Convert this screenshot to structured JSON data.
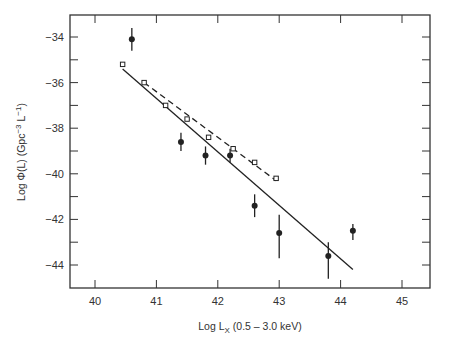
{
  "chart_data": {
    "type": "scatter",
    "title": "",
    "xlabel": "Log L_X (0.5 – 3.0 keV)",
    "ylabel": "Log Φ(L) (Gpc⁻³ L⁻¹)",
    "xlim": [
      39.6,
      45.4
    ],
    "ylim": [
      -45,
      -33
    ],
    "x_ticks": [
      40,
      41,
      42,
      43,
      44,
      45
    ],
    "y_ticks": [
      -34,
      -36,
      -38,
      -40,
      -42,
      -44
    ],
    "x_tick_labels": [
      "40",
      "41",
      "42",
      "43",
      "44",
      "45"
    ],
    "y_tick_labels": [
      "−34",
      "−36",
      "−38",
      "−40",
      "−42",
      "−44"
    ],
    "grid": false,
    "legend": null,
    "series": [
      {
        "name": "filled circles (with error bars)",
        "marker": "filled-circle",
        "points": [
          {
            "x": 40.6,
            "y": -34.1,
            "err_lo": 0.5,
            "err_hi": 0.5
          },
          {
            "x": 41.4,
            "y": -38.6,
            "err_lo": 0.4,
            "err_hi": 0.4
          },
          {
            "x": 41.8,
            "y": -39.2,
            "err_lo": 0.4,
            "err_hi": 0.4
          },
          {
            "x": 42.2,
            "y": -39.2,
            "err_lo": 0.3,
            "err_hi": 0.3
          },
          {
            "x": 42.6,
            "y": -41.4,
            "err_lo": 0.5,
            "err_hi": 0.5
          },
          {
            "x": 43.0,
            "y": -42.6,
            "err_lo": 1.1,
            "err_hi": 0.8
          },
          {
            "x": 43.8,
            "y": -43.6,
            "err_lo": 1.0,
            "err_hi": 0.6
          },
          {
            "x": 44.2,
            "y": -42.5,
            "err_lo": 0.4,
            "err_hi": 0.3
          }
        ]
      },
      {
        "name": "open squares",
        "marker": "open-square",
        "points": [
          {
            "x": 40.45,
            "y": -35.2
          },
          {
            "x": 40.8,
            "y": -36.0
          },
          {
            "x": 41.15,
            "y": -37.0
          },
          {
            "x": 41.5,
            "y": -37.6
          },
          {
            "x": 41.85,
            "y": -38.4
          },
          {
            "x": 42.25,
            "y": -38.9
          },
          {
            "x": 42.6,
            "y": -39.5
          },
          {
            "x": 42.95,
            "y": -40.2
          }
        ]
      },
      {
        "name": "solid fit line",
        "style": "solid",
        "points": [
          {
            "x": 40.45,
            "y": -35.4
          },
          {
            "x": 44.2,
            "y": -44.2
          }
        ]
      },
      {
        "name": "dashed fit line",
        "style": "dashed",
        "points": [
          {
            "x": 40.8,
            "y": -36.0
          },
          {
            "x": 42.95,
            "y": -40.3
          }
        ]
      }
    ]
  },
  "axes": {
    "x_label_main": "Log L",
    "x_label_sub": "X",
    "x_label_rest": " (0.5 – 3.0 keV)",
    "y_label_main": "Log Φ(L) (Gpc",
    "y_label_sup1": "−3",
    "y_label_mid": " L",
    "y_label_sup2": "−1",
    "y_label_end": ")"
  },
  "colors": {
    "ink": "#222222",
    "frame": "#333333",
    "background": "#ffffff"
  }
}
